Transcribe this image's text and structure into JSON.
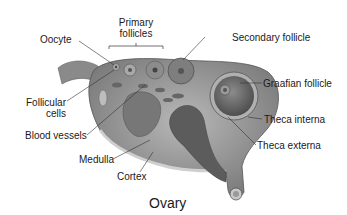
{
  "title": "Ovary",
  "labels": {
    "oocyte": "Oocyte",
    "primary_1": "Primary",
    "primary_2": "follicles",
    "secondary": "Secondary follicle",
    "graafian": "Graafian follicle",
    "follicular_1": "Follicular",
    "follicular_2": "cells",
    "blood_vessels": "Blood vessels",
    "theca_interna": "Theca interna",
    "theca_externa": "Theca externa",
    "medulla": "Medulla",
    "cortex": "Cortex"
  },
  "colors": {
    "tissue": "#9a9a9a",
    "tissue_dark": "#6e6e6e",
    "tissue_light": "#c4c4c4",
    "leader": "#333333"
  }
}
